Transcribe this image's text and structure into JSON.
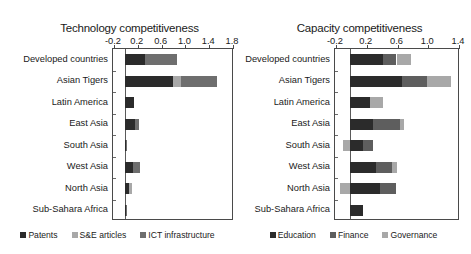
{
  "figure": {
    "background": "#ffffff"
  },
  "chart_data": [
    {
      "id": "technology",
      "type": "bar",
      "orientation": "horizontal",
      "stacked": true,
      "title": "Technology competitiveness",
      "xlabel": "",
      "ylabel": "",
      "xlim": [
        -0.2,
        1.8
      ],
      "xticks": [
        -0.2,
        0.2,
        0.6,
        1.0,
        1.4,
        1.8
      ],
      "xtick_labels": [
        "-0.2",
        "0.2",
        "0.6",
        "1.0",
        "1.4",
        "1.8"
      ],
      "grid": false,
      "legend_position": "bottom",
      "categories": [
        "Developed countries",
        "Asian Tigers",
        "Latin America",
        "East Asia",
        "South Asia",
        "West Asia",
        "North Asia",
        "Sub-Sahara Africa"
      ],
      "series": [
        {
          "name": "Patents",
          "color": "#2b2b2b",
          "values": [
            0.33,
            0.81,
            0.16,
            0.17,
            0.02,
            0.14,
            0.07,
            0.015
          ]
        },
        {
          "name": "S&E articles",
          "color": "#a8a8a8",
          "values": [
            0.0,
            0.14,
            0.0,
            0.0,
            0.0,
            0.0,
            0.05,
            0.0
          ]
        },
        {
          "name": "ICT infrastructure",
          "color": "#6e6e6e",
          "values": [
            0.55,
            0.6,
            0.0,
            0.07,
            0.005,
            0.11,
            0.0,
            0.005
          ]
        }
      ]
    },
    {
      "id": "capacity",
      "type": "bar",
      "orientation": "horizontal",
      "stacked": true,
      "title": "Capacity competitiveness",
      "xlabel": "",
      "ylabel": "",
      "xlim": [
        -0.2,
        1.4
      ],
      "xticks": [
        -0.2,
        0.2,
        0.6,
        1.0,
        1.4
      ],
      "xtick_labels": [
        "-0.2",
        "0.2",
        "0.6",
        "1.0",
        "1.4"
      ],
      "grid": false,
      "legend_position": "bottom",
      "categories": [
        "Developed countries",
        "Asian Tigers",
        "Latin America",
        "East Asia",
        "South Asia",
        "West Asia",
        "North Asia",
        "Sub-Sahara Africa"
      ],
      "series": [
        {
          "name": "Education",
          "color": "#2b2b2b",
          "values": [
            0.42,
            0.67,
            0.26,
            0.3,
            0.17,
            0.33,
            0.39,
            0.16
          ]
        },
        {
          "name": "Finance",
          "color": "#5e5e5e",
          "values": [
            0.18,
            0.33,
            0.0,
            0.34,
            0.12,
            0.21,
            0.2,
            0.0
          ]
        },
        {
          "name": "Governance",
          "color": "#a8a8a8",
          "values": [
            0.19,
            0.31,
            0.16,
            0.06,
            -0.09,
            0.07,
            -0.14,
            0.0
          ]
        }
      ]
    }
  ],
  "legends": {
    "technology": [
      {
        "label": "Patents",
        "color": "#2b2b2b"
      },
      {
        "label": "S&E articles",
        "color": "#a8a8a8"
      },
      {
        "label": "ICT infrastructure",
        "color": "#6e6e6e"
      }
    ],
    "capacity": [
      {
        "label": "Education",
        "color": "#2b2b2b"
      },
      {
        "label": "Finance",
        "color": "#5e5e5e"
      },
      {
        "label": "Governance",
        "color": "#a8a8a8"
      }
    ]
  }
}
